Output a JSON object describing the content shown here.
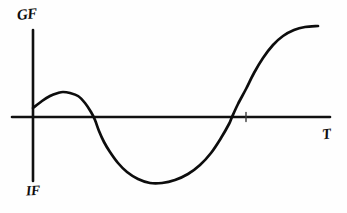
{
  "figure": {
    "kind": "hand-drawn-sketch",
    "background_color": "#fefefe",
    "ink_color": "#0d0d0d"
  },
  "labels": {
    "y_axis_top": "GF",
    "y_axis_bottom": "IF",
    "x_axis_right": "T"
  },
  "chart_data": {
    "type": "line",
    "title": "",
    "xlabel": "T",
    "ylabel": "GF",
    "annotations": [
      "GF",
      "IF",
      "T"
    ],
    "grid": false,
    "legend": false,
    "axes": {
      "origin_px": [
        33,
        117
      ],
      "x_axis_px": [
        [
          12,
          117
        ],
        [
          330,
          117
        ]
      ],
      "y_axis_px": [
        [
          33,
          30
        ],
        [
          33,
          181
        ]
      ],
      "x_tick_px": [
        246,
        117
      ]
    },
    "xlim": [
      0,
      1
    ],
    "ylim": [
      -1,
      1
    ],
    "series": [
      {
        "name": "curve",
        "description": "starts slightly positive, rises to a local maximum, falls steeply through zero, reaches a deep minimum, rises through zero again and saturates at a high plateau",
        "points_px": [
          [
            33,
            108
          ],
          [
            42,
            101
          ],
          [
            50,
            96
          ],
          [
            58,
            93
          ],
          [
            63,
            92
          ],
          [
            70,
            93
          ],
          [
            78,
            96
          ],
          [
            85,
            103
          ],
          [
            91,
            112
          ],
          [
            95,
            120
          ],
          [
            99,
            131
          ],
          [
            104,
            142
          ],
          [
            110,
            152
          ],
          [
            118,
            163
          ],
          [
            127,
            172
          ],
          [
            138,
            179
          ],
          [
            150,
            183
          ],
          [
            162,
            183
          ],
          [
            175,
            180
          ],
          [
            188,
            174
          ],
          [
            200,
            165
          ],
          [
            211,
            153
          ],
          [
            221,
            138
          ],
          [
            229,
            124
          ],
          [
            232,
            117
          ],
          [
            238,
            104
          ],
          [
            246,
            89
          ],
          [
            254,
            73
          ],
          [
            263,
            58
          ],
          [
            273,
            45
          ],
          [
            283,
            36
          ],
          [
            294,
            30
          ],
          [
            305,
            27
          ],
          [
            318,
            26
          ]
        ],
        "key_features": {
          "y_intercept_px": [
            33,
            108
          ],
          "local_maximum_px": [
            63,
            92
          ],
          "first_zero_crossing_px": [
            95,
            117
          ],
          "global_minimum_px": [
            162,
            183
          ],
          "second_zero_crossing_px": [
            232,
            117
          ],
          "plateau_end_px": [
            318,
            26
          ]
        }
      }
    ]
  }
}
